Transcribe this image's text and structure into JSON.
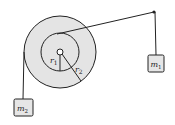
{
  "diagram": {
    "colors": {
      "disk_fill": "#e4e4e4",
      "stroke": "#222222",
      "mass_fill": "#e6e6e6",
      "background": "#ffffff"
    },
    "pulley": {
      "center": [
        60,
        52
      ],
      "outer_radius": 36,
      "inner_radius": 19,
      "axle_radius": 3,
      "labels": {
        "r1": {
          "base": "r",
          "sub": "1"
        },
        "r2": {
          "base": "r",
          "sub": "2"
        }
      }
    },
    "masses": [
      {
        "id": "m1",
        "base": "m",
        "sub": "1",
        "box": [
          148,
          55,
          16,
          17
        ]
      },
      {
        "id": "m2",
        "base": "m",
        "sub": "2",
        "box": [
          14,
          99,
          19,
          17
        ]
      }
    ],
    "pivot": [
      154,
      12
    ]
  }
}
